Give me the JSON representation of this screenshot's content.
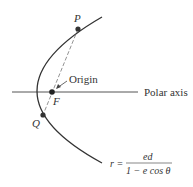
{
  "diagram": {
    "labels": {
      "P": "P",
      "Q": "Q",
      "F": "F",
      "origin": "Origin",
      "polar_axis": "Polar axis"
    },
    "formula": {
      "lhs": "r =",
      "numerator": "ed",
      "denominator": "1 − e cos θ"
    },
    "colors": {
      "curve": "#333333",
      "axis": "#555555",
      "points": "#333333"
    }
  }
}
